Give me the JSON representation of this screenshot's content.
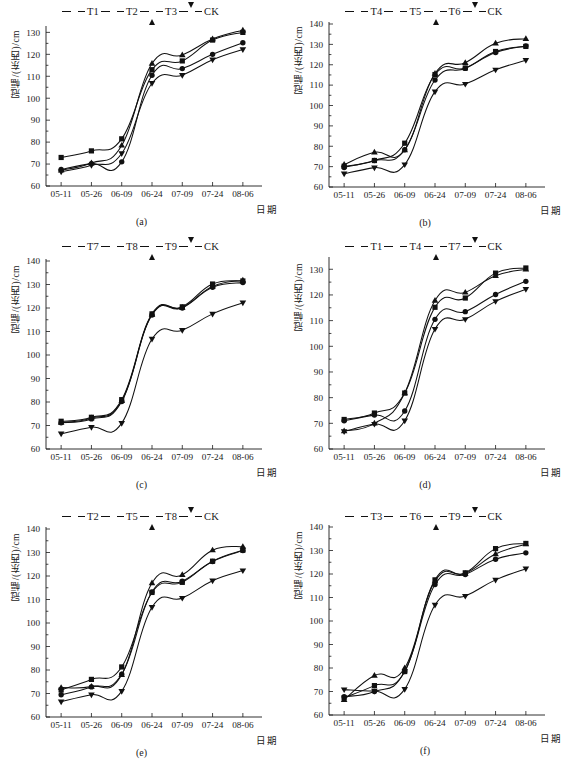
{
  "figure": {
    "ylabel": "冠幅/(东西)/cm",
    "xlabel": "日期",
    "x_categories": [
      "05-11",
      "05-26",
      "06-09",
      "06-24",
      "07-09",
      "07-24",
      "08-06"
    ],
    "legend_markers": [
      "square",
      "circle",
      "triangle-up",
      "triangle-down"
    ]
  },
  "chart_data": [
    {
      "type": "line",
      "caption": "(a)",
      "title": "",
      "xlabel": "日期",
      "ylabel": "冠幅/(东西)/cm",
      "categories": [
        "05-11",
        "05-26",
        "06-09",
        "06-24",
        "07-09",
        "07-24",
        "08-06"
      ],
      "ylim": [
        60,
        132
      ],
      "yticks": [
        60,
        70,
        80,
        90,
        100,
        110,
        120,
        130
      ],
      "grid": false,
      "legend_position": "top-center",
      "series": [
        {
          "name": "T1",
          "marker": "square",
          "values": [
            73.0,
            76.0,
            81.5,
            113.0,
            117.0,
            126.5,
            130.0
          ]
        },
        {
          "name": "T2",
          "marker": "circle",
          "values": [
            67.5,
            70.2,
            71.0,
            110.5,
            113.5,
            120.0,
            125.3
          ]
        },
        {
          "name": "T3",
          "marker": "triangle-up",
          "values": [
            67.2,
            70.5,
            78.5,
            115.8,
            119.7,
            127.0,
            131.0
          ]
        },
        {
          "name": "CK",
          "marker": "triangle-down",
          "values": [
            66.5,
            69.5,
            74.8,
            106.8,
            110.5,
            117.5,
            122.2
          ]
        }
      ]
    },
    {
      "type": "line",
      "caption": "(b)",
      "title": "",
      "xlabel": "日期",
      "ylabel": "冠幅/(东西)/cm",
      "categories": [
        "05-11",
        "05-26",
        "06-09",
        "06-24",
        "07-09",
        "07-24",
        "08-06"
      ],
      "ylim": [
        60,
        140
      ],
      "yticks": [
        60,
        70,
        80,
        90,
        100,
        110,
        120,
        130,
        140
      ],
      "grid": false,
      "legend_position": "top-center",
      "series": [
        {
          "name": "T4",
          "marker": "square",
          "values": [
            70.2,
            73.0,
            81.5,
            115.2,
            118.4,
            126.5,
            129.0
          ]
        },
        {
          "name": "T5",
          "marker": "circle",
          "values": [
            69.6,
            73.0,
            78.3,
            112.5,
            118.2,
            126.0,
            129.2
          ]
        },
        {
          "name": "T6",
          "marker": "triangle-up",
          "values": [
            71.0,
            77.0,
            78.2,
            115.7,
            121.0,
            130.5,
            132.8
          ]
        },
        {
          "name": "CK",
          "marker": "triangle-down",
          "values": [
            66.5,
            69.5,
            71.0,
            106.8,
            110.5,
            117.5,
            122.2
          ]
        }
      ]
    },
    {
      "type": "line",
      "caption": "(c)",
      "title": "",
      "xlabel": "日期",
      "ylabel": "冠幅/(东西)/cm",
      "categories": [
        "05-11",
        "05-26",
        "06-09",
        "06-24",
        "07-09",
        "07-24",
        "08-06"
      ],
      "ylim": [
        60,
        140
      ],
      "yticks": [
        60,
        70,
        80,
        90,
        100,
        110,
        120,
        130,
        140
      ],
      "grid": false,
      "legend_position": "top-center",
      "series": [
        {
          "name": "T7",
          "marker": "square",
          "values": [
            71.8,
            73.5,
            81.0,
            117.5,
            120.5,
            130.2,
            131.5
          ]
        },
        {
          "name": "T8",
          "marker": "circle",
          "values": [
            71.2,
            72.8,
            80.2,
            117.0,
            120.0,
            128.8,
            130.8
          ]
        },
        {
          "name": "T9",
          "marker": "triangle-up",
          "values": [
            71.3,
            73.2,
            80.5,
            117.2,
            120.2,
            129.2,
            131.8
          ]
        },
        {
          "name": "CK",
          "marker": "triangle-down",
          "values": [
            66.5,
            69.3,
            71.0,
            106.8,
            110.5,
            117.5,
            122.2
          ]
        }
      ]
    },
    {
      "type": "line",
      "caption": "(d)",
      "title": "",
      "xlabel": "日期",
      "ylabel": "冠幅/(东西)/cm",
      "categories": [
        "05-11",
        "05-26",
        "06-09",
        "06-24",
        "07-09",
        "07-24",
        "08-06"
      ],
      "ylim": [
        60,
        134
      ],
      "yticks": [
        60,
        70,
        80,
        90,
        100,
        110,
        120,
        130
      ],
      "grid": false,
      "legend_position": "top-center",
      "series": [
        {
          "name": "T1",
          "marker": "square",
          "values": [
            71.5,
            74.0,
            81.8,
            115.2,
            118.8,
            128.5,
            130.5
          ]
        },
        {
          "name": "T4",
          "marker": "circle",
          "values": [
            71.0,
            73.2,
            74.8,
            110.5,
            113.5,
            120.2,
            125.3
          ]
        },
        {
          "name": "T7",
          "marker": "triangle-up",
          "values": [
            67.0,
            70.0,
            81.8,
            117.8,
            121.0,
            127.5,
            130.0
          ]
        },
        {
          "name": "CK",
          "marker": "triangle-down",
          "values": [
            66.8,
            69.7,
            71.0,
            106.7,
            110.5,
            117.5,
            122.2
          ]
        }
      ]
    },
    {
      "type": "line",
      "caption": "(e)",
      "title": "",
      "xlabel": "日期",
      "ylabel": "冠幅/(东西)/cm",
      "categories": [
        "05-11",
        "05-26",
        "06-09",
        "06-24",
        "07-09",
        "07-24",
        "08-06"
      ],
      "ylim": [
        60,
        140
      ],
      "yticks": [
        60,
        70,
        80,
        90,
        100,
        110,
        120,
        130,
        140
      ],
      "grid": false,
      "legend_position": "top-center",
      "series": [
        {
          "name": "T2",
          "marker": "square",
          "values": [
            71.5,
            76.0,
            81.3,
            113.0,
            117.3,
            126.3,
            131.0
          ]
        },
        {
          "name": "T5",
          "marker": "circle",
          "values": [
            69.5,
            72.8,
            78.2,
            113.2,
            117.8,
            126.2,
            130.8
          ]
        },
        {
          "name": "T8",
          "marker": "triangle-up",
          "values": [
            72.5,
            73.0,
            78.0,
            117.0,
            120.5,
            131.0,
            132.5
          ]
        },
        {
          "name": "CK",
          "marker": "triangle-down",
          "values": [
            66.5,
            69.5,
            71.0,
            106.7,
            110.6,
            118.0,
            122.3
          ]
        }
      ]
    },
    {
      "type": "line",
      "caption": "(f)",
      "title": "",
      "xlabel": "日期",
      "ylabel": "冠幅/(东西)/cm",
      "categories": [
        "05-11",
        "05-26",
        "06-09",
        "06-24",
        "07-09",
        "07-24",
        "08-06"
      ],
      "ylim": [
        60,
        140
      ],
      "yticks": [
        60,
        70,
        80,
        90,
        100,
        110,
        120,
        130,
        140
      ],
      "grid": false,
      "legend_position": "top-center",
      "series": [
        {
          "name": "T3",
          "marker": "square",
          "values": [
            67.3,
            72.5,
            78.5,
            117.5,
            120.5,
            130.8,
            133.0
          ]
        },
        {
          "name": "T6",
          "marker": "circle",
          "values": [
            67.8,
            70.0,
            78.5,
            115.5,
            119.8,
            126.3,
            129.0
          ]
        },
        {
          "name": "T9",
          "marker": "triangle-up",
          "values": [
            66.5,
            76.8,
            80.0,
            117.0,
            120.2,
            128.5,
            132.7
          ]
        },
        {
          "name": "CK",
          "marker": "triangle-down",
          "values": [
            70.8,
            70.2,
            71.0,
            106.8,
            110.6,
            117.5,
            122.2
          ]
        }
      ]
    }
  ]
}
